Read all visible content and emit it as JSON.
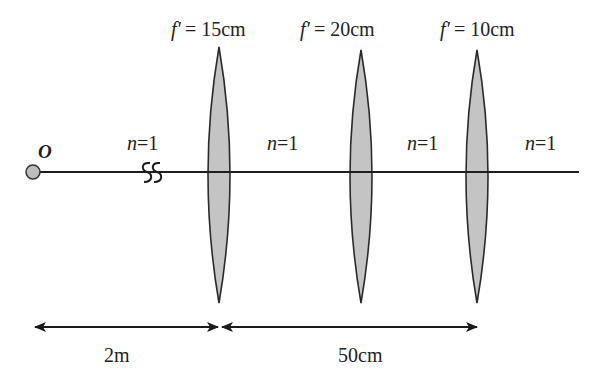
{
  "diagram": {
    "type": "optical-system",
    "object": {
      "label": "O",
      "x": 33
    },
    "axis": {
      "y": 172,
      "x_start": 33,
      "x_end": 579
    },
    "break_symbol": {
      "x": 150
    },
    "lenses": [
      {
        "focal_label": "f′ = 15cm",
        "focal_prefix": "f′",
        "focal_value": "= 15cm",
        "cx": 219
      },
      {
        "focal_label": "f′ = 20cm",
        "focal_prefix": "f′",
        "focal_value": "= 20cm",
        "cx": 360
      },
      {
        "focal_label": "f′ = 10cm",
        "focal_prefix": "f′",
        "focal_value": "= 10cm",
        "cx": 477
      }
    ],
    "media": [
      {
        "label": "n=1",
        "n": "n",
        "eq": "=1",
        "x": 148
      },
      {
        "label": "n=1",
        "n": "n",
        "eq": "=1",
        "x": 288
      },
      {
        "label": "n=1",
        "n": "n",
        "eq": "=1",
        "x": 428
      },
      {
        "label": "n=1",
        "n": "n",
        "eq": "=1",
        "x": 546
      }
    ],
    "dimensions": [
      {
        "label": "2m",
        "from": 35,
        "to": 218
      },
      {
        "label": "50cm",
        "from": 222,
        "to": 477
      }
    ],
    "colors": {
      "lens_fill": "#c4c4c4",
      "stroke": "#2a2a2a",
      "object_fill": "#bdbdbd"
    }
  }
}
